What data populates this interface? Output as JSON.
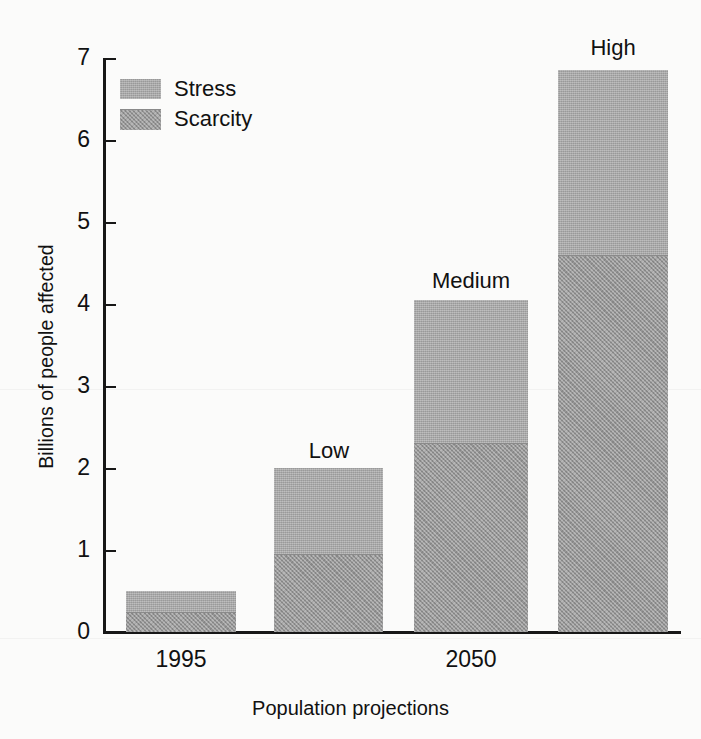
{
  "chart_data": {
    "type": "bar",
    "title": "",
    "subtitle": "",
    "xlabel": "Population projections",
    "ylabel": "Billions of people affected",
    "ylim": [
      0,
      7
    ],
    "yticks": [
      0,
      1,
      2,
      3,
      4,
      5,
      6,
      7
    ],
    "ytick_labels": [
      "0",
      "1",
      "2",
      "3",
      "4",
      "5",
      "6",
      "7"
    ],
    "grid": false,
    "stacked": true,
    "legend_position": "top-left",
    "categories": [
      "1995",
      "Low",
      "Medium",
      "High"
    ],
    "group_labels": [
      "1995",
      "2050"
    ],
    "bar_captions": [
      "",
      "Low",
      "Medium",
      "High"
    ],
    "series": [
      {
        "name": "Scarcity",
        "color": "#9b9b9b",
        "values": [
          0.25,
          0.95,
          2.3,
          4.6
        ]
      },
      {
        "name": "Stress",
        "color": "#a8a8a8",
        "values": [
          0.25,
          1.05,
          1.75,
          2.25
        ]
      }
    ],
    "totals": [
      0.5,
      2.0,
      4.05,
      6.85
    ]
  },
  "legend": {
    "items": [
      {
        "label": "Stress",
        "color": "#a8a8a8"
      },
      {
        "label": "Scarcity",
        "color": "#9b9b9b"
      }
    ]
  },
  "axes": {
    "y": {
      "title": "Billions of people affected",
      "ticks": [
        "7",
        "6",
        "5",
        "4",
        "3",
        "2",
        "1",
        "0"
      ]
    },
    "x": {
      "title": "Population projections",
      "groups": [
        {
          "label": "1995"
        },
        {
          "label": "2050"
        }
      ]
    }
  },
  "bars": [
    {
      "caption": "",
      "group": "1995",
      "scarcity": 0.25,
      "stress": 0.25,
      "total": 0.5
    },
    {
      "caption": "Low",
      "group": "2050",
      "scarcity": 0.95,
      "stress": 1.05,
      "total": 2.0
    },
    {
      "caption": "Medium",
      "group": "2050",
      "scarcity": 2.3,
      "stress": 1.75,
      "total": 4.05
    },
    {
      "caption": "High",
      "group": "2050",
      "scarcity": 4.6,
      "stress": 2.25,
      "total": 6.85
    }
  ]
}
